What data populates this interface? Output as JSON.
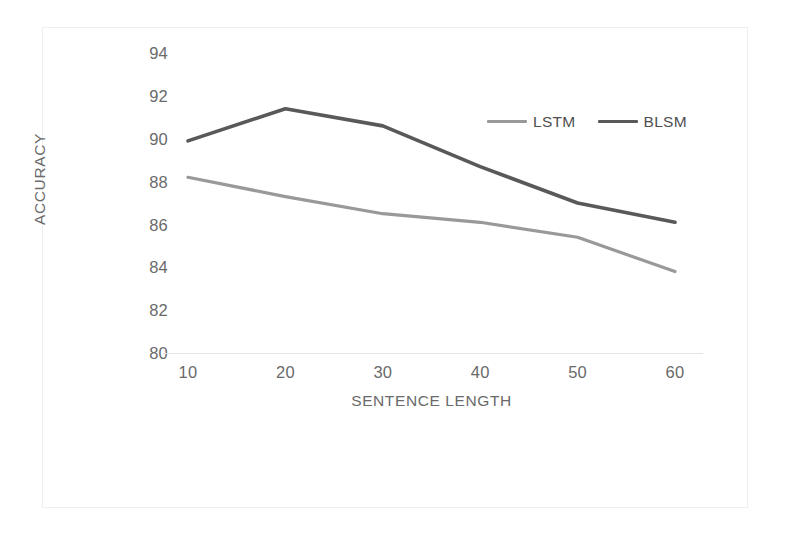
{
  "chart_data": {
    "type": "line",
    "title": "",
    "xlabel": "SENTENCE LENGTH",
    "ylabel": "ACCURACY",
    "categories": [
      "10",
      "20",
      "30",
      "40",
      "50",
      "60"
    ],
    "x": [
      10,
      20,
      30,
      40,
      50,
      60
    ],
    "series": [
      {
        "name": "LSTM",
        "color": "#999999",
        "values": [
          88.2,
          87.3,
          86.5,
          86.1,
          85.4,
          83.8
        ]
      },
      {
        "name": "BLSM",
        "color": "#595959",
        "values": [
          89.9,
          91.4,
          90.6,
          88.7,
          87.0,
          86.1
        ]
      }
    ],
    "ylim": [
      80,
      94
    ],
    "yticks": [
      "80",
      "82",
      "84",
      "86",
      "88",
      "90",
      "92",
      "94"
    ],
    "xlim": [
      10,
      60
    ],
    "xticks": [
      "10",
      "20",
      "30",
      "40",
      "50",
      "60"
    ],
    "grid": false,
    "legend_position": "top-right-inside",
    "markers": false,
    "axis_color": "#e3e3e3",
    "tick_label_color": "#6a6a6a",
    "frame_color": "#efefef",
    "background_color": "#ffffff"
  }
}
